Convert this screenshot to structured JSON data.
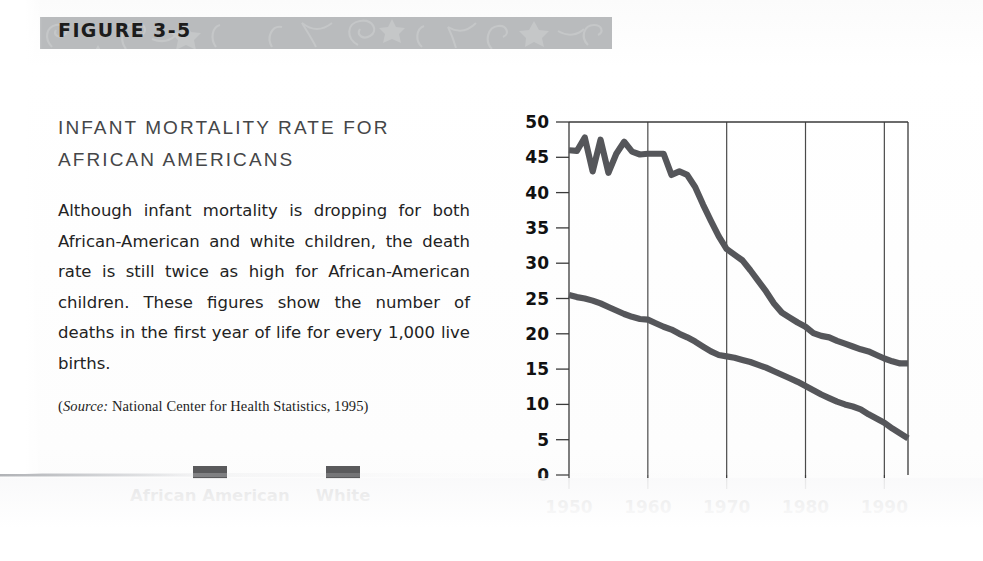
{
  "figure": {
    "label": "FIGURE 3-5",
    "band_color": "#b9bbbd"
  },
  "chart_title": "INFANT MORTALITY RATE FOR AFRICAN AMERICANS",
  "body_text": "Although infant mortality is dropping for both African-American and white children, the death rate is still twice as high for African-American children. These figures show the number of deaths in the first year of life for every 1,000 live births.",
  "source": {
    "prefix": "(",
    "emphasis": "Source:",
    "text": " National Center for Health Statistics, 1995)"
  },
  "legend": {
    "items": [
      {
        "label": "African American",
        "color": "#5a5a5c"
      },
      {
        "label": "White",
        "color": "#5a5a5c"
      }
    ]
  },
  "chart_data": {
    "type": "line",
    "title": "INFANT MORTALITY RATE FOR AFRICAN AMERICANS",
    "xlabel": "",
    "ylabel": "",
    "xlim": [
      1950,
      1993
    ],
    "ylim": [
      0,
      50
    ],
    "ytick_labels": [
      "0",
      "5",
      "10",
      "15",
      "20",
      "25",
      "30",
      "35",
      "40",
      "45",
      "50"
    ],
    "yticks": [
      0,
      5,
      10,
      15,
      20,
      25,
      30,
      35,
      40,
      45,
      50
    ],
    "xtick_labels": [
      "1950",
      "1960",
      "1970",
      "1980",
      "1990"
    ],
    "xticks": [
      1950,
      1960,
      1970,
      1980,
      1990
    ],
    "grid": "vertical",
    "grid_x": [
      1960,
      1970,
      1980,
      1990
    ],
    "legend_position": "below-left",
    "line_color": "#55565a",
    "series": [
      {
        "name": "African American",
        "x": [
          1950,
          1951,
          1952,
          1953,
          1954,
          1955,
          1956,
          1957,
          1958,
          1959,
          1960,
          1961,
          1962,
          1963,
          1964,
          1965,
          1966,
          1967,
          1968,
          1969,
          1970,
          1971,
          1972,
          1973,
          1974,
          1975,
          1976,
          1977,
          1978,
          1979,
          1980,
          1981,
          1982,
          1983,
          1984,
          1985,
          1986,
          1987,
          1988,
          1989,
          1990,
          1991,
          1992,
          1993
        ],
        "values": [
          46.0,
          45.9,
          47.8,
          43.0,
          47.5,
          42.8,
          45.5,
          47.2,
          45.8,
          45.4,
          45.5,
          45.5,
          45.5,
          42.5,
          43.0,
          42.5,
          40.8,
          38.3,
          36.0,
          33.8,
          32.0,
          31.2,
          30.4,
          29.0,
          27.5,
          26.0,
          24.3,
          23.0,
          22.3,
          21.6,
          21.0,
          20.1,
          19.7,
          19.5,
          19.0,
          18.6,
          18.2,
          17.8,
          17.5,
          17.0,
          16.5,
          16.1,
          15.8,
          15.8
        ]
      },
      {
        "name": "White",
        "x": [
          1950,
          1951,
          1952,
          1953,
          1954,
          1955,
          1956,
          1957,
          1958,
          1959,
          1960,
          1961,
          1962,
          1963,
          1964,
          1965,
          1966,
          1967,
          1968,
          1969,
          1970,
          1971,
          1972,
          1973,
          1974,
          1975,
          1976,
          1977,
          1978,
          1979,
          1980,
          1981,
          1982,
          1983,
          1984,
          1985,
          1986,
          1987,
          1988,
          1989,
          1990,
          1991,
          1992,
          1993
        ],
        "values": [
          25.5,
          25.2,
          25.0,
          24.7,
          24.3,
          23.8,
          23.3,
          22.8,
          22.4,
          22.1,
          22.0,
          21.5,
          21.0,
          20.6,
          20.0,
          19.5,
          18.9,
          18.2,
          17.5,
          17.0,
          16.8,
          16.6,
          16.3,
          16.0,
          15.6,
          15.2,
          14.7,
          14.2,
          13.7,
          13.2,
          12.6,
          12.0,
          11.4,
          10.9,
          10.4,
          10.0,
          9.7,
          9.3,
          8.6,
          8.0,
          7.4,
          6.6,
          5.9,
          5.2
        ]
      }
    ]
  }
}
